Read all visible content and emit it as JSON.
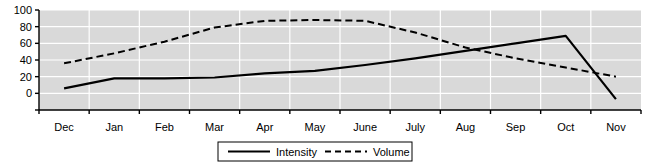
{
  "chart_data": {
    "type": "line",
    "title": "",
    "subtitle": "",
    "xlabel": "",
    "ylabel": "",
    "categories": [
      "Dec",
      "Jan",
      "Feb",
      "Mar",
      "Apr",
      "May",
      "June",
      "July",
      "Aug",
      "Sep",
      "Oct",
      "Nov"
    ],
    "ylim": [
      -20,
      100
    ],
    "yticks": [
      0,
      20,
      40,
      60,
      80,
      100
    ],
    "ytick_labels": [
      "0",
      "20",
      "40",
      "60",
      "80",
      "100"
    ],
    "grid": true,
    "grid_color": "#ffffff",
    "plot_background": "#d9d9d9",
    "axis_color": "#000000",
    "legend_position": "bottom",
    "series": [
      {
        "name": "Intensity",
        "style": "solid",
        "color": "#000000",
        "values": [
          6,
          18,
          18,
          19,
          24,
          27,
          34,
          42,
          51,
          60,
          69,
          -7
        ]
      },
      {
        "name": "Volume",
        "style": "dashed",
        "color": "#000000",
        "values": [
          36,
          48,
          62,
          79,
          87,
          88,
          87,
          73,
          55,
          42,
          31,
          20
        ]
      }
    ]
  },
  "legend": {
    "entries": [
      {
        "label": "Intensity",
        "style": "solid"
      },
      {
        "label": "Volume",
        "style": "dashed"
      }
    ]
  }
}
